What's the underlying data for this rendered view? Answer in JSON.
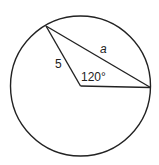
{
  "diagram": {
    "type": "circle-geometry",
    "stroke_color": "#222222",
    "background": "#ffffff",
    "labels": {
      "radius": "5",
      "chord": "a",
      "central_angle": "120°"
    },
    "geometry": {
      "radius_value": 5,
      "central_angle_degrees": 120
    }
  }
}
